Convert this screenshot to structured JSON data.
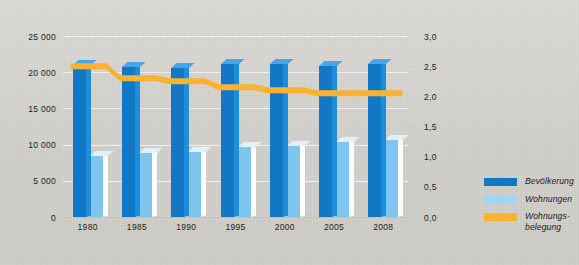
{
  "chart_data": {
    "type": "bar",
    "title": "",
    "subtitle": "",
    "xlabel": "",
    "ylabel": "",
    "categories": [
      "1980",
      "1985",
      "1990",
      "1995",
      "2000",
      "2005",
      "2008"
    ],
    "grid": true,
    "legend_position": "right",
    "axes": {
      "left": {
        "ylabel": "",
        "ylim": [
          0,
          25000
        ],
        "ticks": [
          0,
          5000,
          10000,
          15000,
          20000,
          25000
        ],
        "tick_labels": [
          "0",
          "5 000",
          "10 000",
          "15 000",
          "20 000",
          "25 000"
        ]
      },
      "right": {
        "ylabel": "",
        "ylim": [
          0,
          3.0
        ],
        "ticks": [
          0.0,
          0.5,
          1.0,
          1.5,
          2.0,
          2.5,
          3.0
        ],
        "tick_labels": [
          "0,0",
          "0,5",
          "1,0",
          "1,5",
          "2,0",
          "2,5",
          "3,0"
        ]
      }
    },
    "series": [
      {
        "name": "Bevölkerung",
        "type": "bar",
        "axis": "left",
        "color": "#1277c4",
        "values": [
          21000,
          20700,
          20600,
          21200,
          21100,
          20900,
          21200
        ]
      },
      {
        "name": "Wohnungen",
        "type": "bar",
        "axis": "left",
        "color": "#7fc6ef",
        "values": [
          8400,
          8800,
          9000,
          9700,
          9800,
          10300,
          10700
        ]
      },
      {
        "name": "Wohnungsbelegung",
        "type": "line",
        "axis": "right",
        "color": "#f9b232",
        "values": [
          2.55,
          2.35,
          2.3,
          2.2,
          2.15,
          2.1,
          2.1
        ]
      }
    ]
  },
  "legend": {
    "items": [
      {
        "label": "Bevölkerung",
        "color": "#1277c4"
      },
      {
        "label": "Wohnungen",
        "color": "#9fd6f3"
      },
      {
        "label": "Wohnungs-\nbelegung",
        "color": "#f9b232"
      }
    ],
    "item_0_label": "Bevölkerung",
    "item_1_label": "Wohnungen",
    "item_2_label_line1": "Wohnungs-",
    "item_2_label_line2": "belegung"
  },
  "axis_left_labels": {
    "t0": "0",
    "t1": "5 000",
    "t2": "10 000",
    "t3": "15 000",
    "t4": "20 000",
    "t5": "25 000"
  },
  "axis_right_labels": {
    "t0": "0,0",
    "t1": "0,5",
    "t2": "1,0",
    "t3": "1,5",
    "t4": "2,0",
    "t5": "2,5",
    "t6": "3,0"
  },
  "x_labels": {
    "c0": "1980",
    "c1": "1985",
    "c2": "1990",
    "c3": "1995",
    "c4": "2000",
    "c5": "2005",
    "c6": "2008"
  }
}
